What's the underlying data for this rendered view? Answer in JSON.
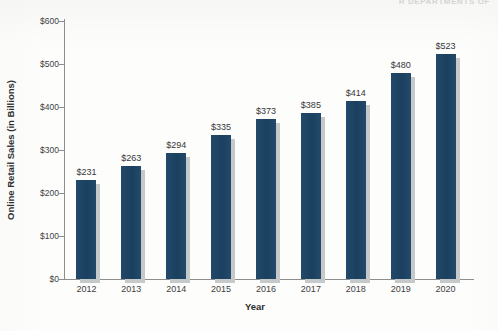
{
  "header_fragment": "R DEPARTMENTS OF",
  "chart_data": {
    "type": "bar",
    "title": "",
    "xlabel": "Year",
    "ylabel": "Online Retail Sales (in Billions)",
    "categories": [
      "2012",
      "2013",
      "2014",
      "2015",
      "2016",
      "2017",
      "2018",
      "2019",
      "2020"
    ],
    "values": [
      231,
      263,
      294,
      335,
      373,
      385,
      414,
      480,
      523
    ],
    "value_labels": [
      "$231",
      "$263",
      "$294",
      "$335",
      "$373",
      "$385",
      "$414",
      "$480",
      "$523"
    ],
    "ylim": [
      0,
      600
    ],
    "ytick_values": [
      0,
      100,
      200,
      300,
      400,
      500,
      600
    ],
    "ytick_labels": [
      "$0",
      "$100",
      "$200",
      "$300",
      "$400",
      "$500",
      "$600"
    ],
    "grid": false,
    "legend": "none",
    "bar_color": "#1d4464",
    "shadow_color": "#c6c9ca",
    "axis_color": "#8d8d8d"
  }
}
